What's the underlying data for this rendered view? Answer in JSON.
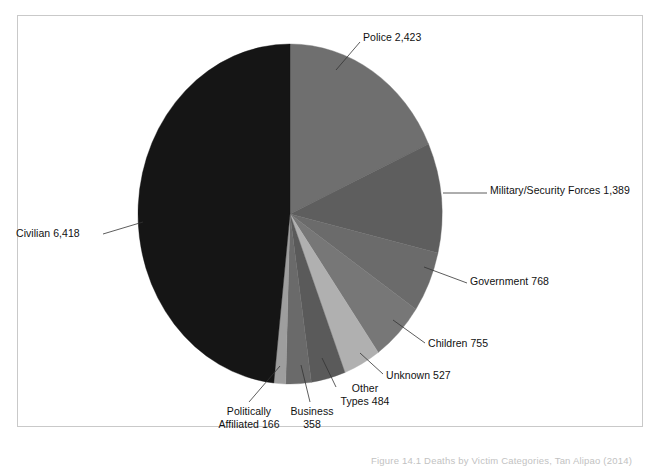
{
  "figure": {
    "caption": "Figure 14.1 Deaths by Victim Categories, Tan Alipao (2014)",
    "frame_color": "#c9c9c9",
    "background": "#ffffff"
  },
  "chart_data": {
    "type": "pie",
    "title": "",
    "xlabel": "",
    "ylabel": "",
    "total": 13288,
    "start_angle_deg": 0,
    "direction": "clockwise",
    "legend_position": "none",
    "grid": false,
    "categories": [
      "Police",
      "Military/Security Forces",
      "Government",
      "Children",
      "Unknown",
      "Other Types",
      "Business",
      "Politically Affiliated",
      "Civilian"
    ],
    "values": [
      2423,
      1389,
      768,
      755,
      527,
      484,
      358,
      166,
      6418
    ],
    "value_labels": [
      "2,423",
      "1,389",
      "768",
      "755",
      "527",
      "484",
      "358",
      "166",
      "6,418"
    ],
    "colors": [
      "#6f6f6f",
      "#5e5e5e",
      "#6b6b6b",
      "#777777",
      "#b0b0b0",
      "#5a5a5a",
      "#6a6a6a",
      "#9e9e9e",
      "#151515"
    ],
    "slices": [
      {
        "label": "Police 2,423",
        "name": "Police",
        "value": 2423,
        "value_label": "2,423",
        "percent": 18.2,
        "color": "#6f6f6f"
      },
      {
        "label": "Military/Security Forces 1,389",
        "name": "Military/Security Forces",
        "value": 1389,
        "value_label": "1,389",
        "percent": 10.5,
        "color": "#5e5e5e"
      },
      {
        "label": "Government 768",
        "name": "Government",
        "value": 768,
        "value_label": "768",
        "percent": 5.8,
        "color": "#6b6b6b"
      },
      {
        "label": "Children 755",
        "name": "Children",
        "value": 755,
        "value_label": "755",
        "percent": 5.7,
        "color": "#777777"
      },
      {
        "label": "Unknown 527",
        "name": "Unknown",
        "value": 527,
        "value_label": "527",
        "percent": 4.0,
        "color": "#b0b0b0"
      },
      {
        "label": "Other Types 484",
        "name": "Other Types",
        "value": 484,
        "value_label": "484",
        "percent": 3.6,
        "color": "#5a5a5a"
      },
      {
        "label": "Business 358",
        "name": "Business",
        "value": 358,
        "value_label": "358",
        "percent": 2.7,
        "color": "#6a6a6a"
      },
      {
        "label": "Politically Affiliated 166",
        "name": "Politically Affiliated",
        "value": 166,
        "value_label": "166",
        "percent": 1.2,
        "color": "#9e9e9e"
      },
      {
        "label": "Civilian 6,418",
        "name": "Civilian",
        "value": 6418,
        "value_label": "6,418",
        "percent": 48.3,
        "color": "#151515"
      }
    ]
  },
  "labels": {
    "police": "Police 2,423",
    "military": "Military/Security Forces 1,389",
    "government": "Government 768",
    "children": "Children 755",
    "unknown": "Unknown 527",
    "other_line1": "Other",
    "other_line2": "Types 484",
    "business_line1": "Business",
    "business_line2": "358",
    "political_line1": "Politically",
    "political_line2": "Affiliated 166",
    "civilian": "Civilian 6,418"
  }
}
